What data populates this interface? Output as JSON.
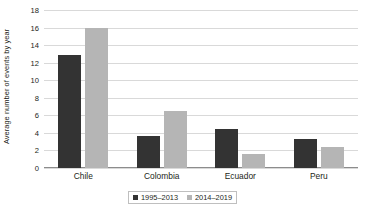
{
  "chart_data": {
    "type": "bar",
    "title": "",
    "subtitle": "",
    "xlabel": "",
    "ylabel": "Average number of events by year",
    "categories": [
      "Chile",
      "Colombia",
      "Ecuador",
      "Peru"
    ],
    "series": [
      {
        "name": "1995–2013",
        "color": "#333333",
        "values": [
          12.9,
          3.6,
          4.4,
          3.3
        ]
      },
      {
        "name": "2014–2019",
        "color": "#b5b5b5",
        "values": [
          16.0,
          6.5,
          1.6,
          2.4
        ]
      }
    ],
    "ylim": [
      0,
      18
    ],
    "ytick_step": 2,
    "yticks": [
      "18",
      "16",
      "14",
      "12",
      "10",
      "8",
      "6",
      "4",
      "2",
      "0"
    ],
    "grid": "horizontal",
    "legend_position": "bottom-center",
    "legend_border_color": "#bfbfbf",
    "gridline_color": "#d9d9d9",
    "axis_color": "#8c8c8c",
    "background_color": "#ffffff"
  }
}
